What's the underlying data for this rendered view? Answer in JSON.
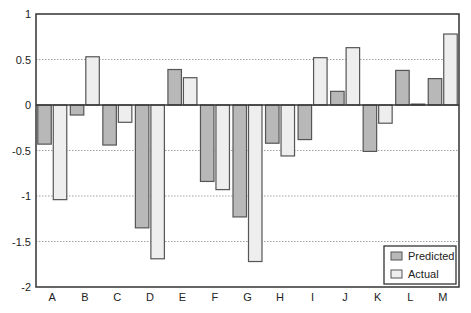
{
  "chart_data": {
    "type": "bar",
    "title": "",
    "xlabel": "",
    "ylabel": "",
    "ylim": [
      -2,
      1
    ],
    "yticks": [
      1,
      0.5,
      0,
      -0.5,
      -1,
      -1.5,
      -2
    ],
    "ytick_labels": [
      "1",
      "0.5",
      "0",
      "-0.5",
      "-1",
      "-1.5",
      "-2"
    ],
    "grid": "horizontal dotted at 0.5 steps",
    "legend_position": "lower right",
    "categories": [
      "A",
      "B",
      "C",
      "D",
      "E",
      "F",
      "G",
      "H",
      "I",
      "J",
      "K",
      "L",
      "M"
    ],
    "series": [
      {
        "name": "Predicted",
        "color": "#b8b8b8",
        "values": [
          -0.43,
          -0.11,
          -0.44,
          -1.35,
          0.39,
          -0.84,
          -1.23,
          -0.42,
          -0.38,
          0.15,
          -0.51,
          0.38,
          0.29
        ]
      },
      {
        "name": "Actual",
        "color": "#eeeeee",
        "values": [
          -1.04,
          0.53,
          -0.19,
          -1.69,
          0.3,
          -0.93,
          -1.72,
          -0.56,
          0.52,
          0.63,
          -0.2,
          0.01,
          0.78
        ]
      }
    ]
  },
  "style": {
    "border_color": "#555555",
    "frame_color": "#333333",
    "grid_color": "#888888"
  }
}
